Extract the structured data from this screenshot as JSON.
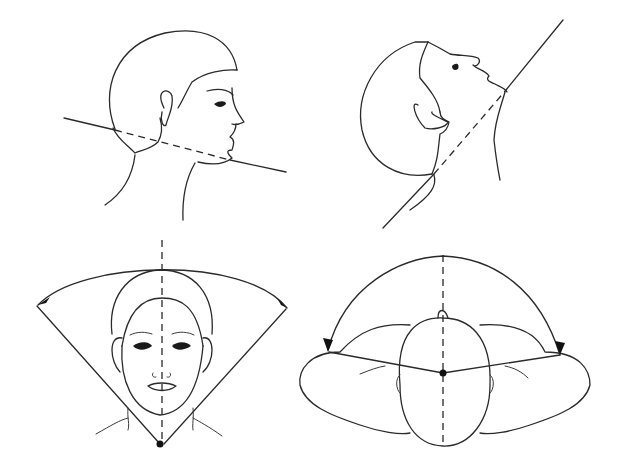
{
  "figure": {
    "panels": [
      {
        "id": "neutral-profile",
        "label": "Head profile, neutral position with reference line and dashed jaw line"
      },
      {
        "id": "extended-profile",
        "label": "Head profile, neck extended with reference line and dashed jaw line"
      },
      {
        "id": "frontal-lateral-flexion",
        "label": "Frontal face with midline and lateral flexion arc arrows"
      },
      {
        "id": "top-rotation",
        "label": "Top view of head and shoulders with midline and rotation arc arrows"
      }
    ],
    "colors": {
      "stroke": "#2a2a2a",
      "background": "#ffffff"
    }
  }
}
